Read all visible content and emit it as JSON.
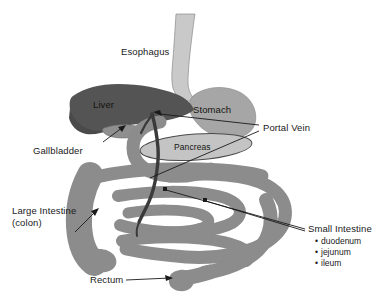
{
  "figure": {
    "background_color": "#ffffff"
  },
  "palette": {
    "liver": "#545454",
    "stomach": "#a6a6a6",
    "esophagus": "#c9c9c9",
    "pancreas": "#c4c4c4",
    "intestine": "#8c8c8c",
    "gallbladder": "#8f8f8f",
    "portal_vein": "#3a3a3a",
    "outline": "#2b2b2b",
    "text": "#1a1a1a"
  },
  "labels": {
    "esophagus": "Esophagus",
    "liver": "Liver",
    "stomach": "Stomach",
    "pancreas": "Pancreas",
    "portal_vein": "Portal Vein",
    "gallbladder": "Gallbladder",
    "large_intestine_line1": "Large Intestine",
    "large_intestine_line2": "(colon)",
    "small_intestine": "Small Intestine",
    "rectum": "Rectum"
  },
  "small_intestine_parts": [
    "duodenum",
    "jejunum",
    "ileum"
  ],
  "organs": [
    {
      "name": "esophagus",
      "label": "Esophagus",
      "fill": "#c9c9c9"
    },
    {
      "name": "stomach",
      "label": "Stomach",
      "fill": "#a6a6a6"
    },
    {
      "name": "liver",
      "label": "Liver",
      "fill": "#545454"
    },
    {
      "name": "gallbladder",
      "label": "Gallbladder",
      "fill": "#8f8f8f"
    },
    {
      "name": "pancreas",
      "label": "Pancreas",
      "fill": "#c4c4c4"
    },
    {
      "name": "portal-vein",
      "label": "Portal Vein",
      "fill": "#3a3a3a"
    },
    {
      "name": "large-intestine",
      "label": "Large Intestine (colon)",
      "fill": "#8c8c8c"
    },
    {
      "name": "small-intestine",
      "label": "Small Intestine",
      "fill": "#8c8c8c"
    },
    {
      "name": "rectum",
      "label": "Rectum",
      "fill": "#8c8c8c"
    }
  ]
}
